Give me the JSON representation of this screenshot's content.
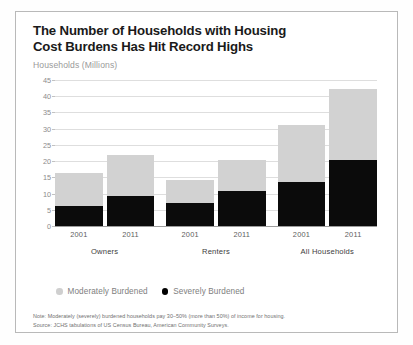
{
  "header": {
    "title_line1": "The Number of Households with Housing",
    "title_line2": "Cost Burdens Has Hit Record Highs",
    "subtitle": "Households (Millions)"
  },
  "legend": {
    "items": [
      {
        "label": "Moderately Burdened",
        "marker": "legend-dot-moderate",
        "color": "#cfcfcf"
      },
      {
        "label": "Severely Burdened",
        "marker": "legend-dot-severe",
        "color": "#000000"
      }
    ]
  },
  "notes": {
    "line1": "Note: Moderately (severely) burdened households pay 30–50% (more than 50%) of income for housing.",
    "line2": "Source: JCHS tabulations of US Census Bureau, American Community Surveys."
  },
  "chart_data": {
    "type": "bar",
    "stacked": true,
    "title": "The Number of Households with Housing Cost Burdens Has Hit Record Highs",
    "subtitle": "Households (Millions)",
    "xlabel": "",
    "ylabel": "Households (Millions)",
    "ylim": [
      0,
      45
    ],
    "yticks": [
      0,
      5,
      10,
      15,
      20,
      25,
      30,
      35,
      40,
      45
    ],
    "grid": true,
    "legend_position": "bottom-left",
    "categories": [
      "2001",
      "2011",
      "2001",
      "2011",
      "2001",
      "2011"
    ],
    "groups": [
      {
        "label": "Owners",
        "categories": [
          "2001",
          "2011"
        ]
      },
      {
        "label": "Renters",
        "categories": [
          "2001",
          "2011"
        ]
      },
      {
        "label": "All Households",
        "categories": [
          "2001",
          "2011"
        ]
      }
    ],
    "series": [
      {
        "name": "Severely Burdened",
        "color": "#0b0b0b",
        "values": [
          6.3,
          9.1,
          7.1,
          10.9,
          13.5,
          20.2
        ]
      },
      {
        "name": "Moderately Burdened",
        "color": "#d2d2d2",
        "values": [
          10.0,
          12.7,
          7.1,
          9.3,
          17.5,
          22.0
        ]
      }
    ],
    "totals": [
      16.3,
      21.8,
      14.2,
      20.2,
      31.0,
      42.2
    ]
  }
}
